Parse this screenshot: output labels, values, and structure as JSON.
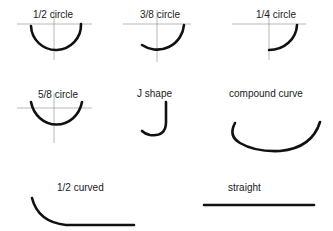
{
  "diagram": {
    "colors": {
      "curve": "#111111",
      "axis": "#8a8a8a",
      "label": "#1a1a1a",
      "background": "#ffffff"
    },
    "shapes": [
      {
        "id": "half-circle",
        "label": "1/2 circle"
      },
      {
        "id": "three-eighths-circle",
        "label": "3/8 circle"
      },
      {
        "id": "quarter-circle",
        "label": "1/4 circle"
      },
      {
        "id": "five-eighths-circle",
        "label": "5/8 circle"
      },
      {
        "id": "j-shape",
        "label": "J shape"
      },
      {
        "id": "compound-curve",
        "label": "compound curve"
      },
      {
        "id": "half-curved",
        "label": "1/2 curved"
      },
      {
        "id": "straight",
        "label": "straight"
      }
    ]
  }
}
